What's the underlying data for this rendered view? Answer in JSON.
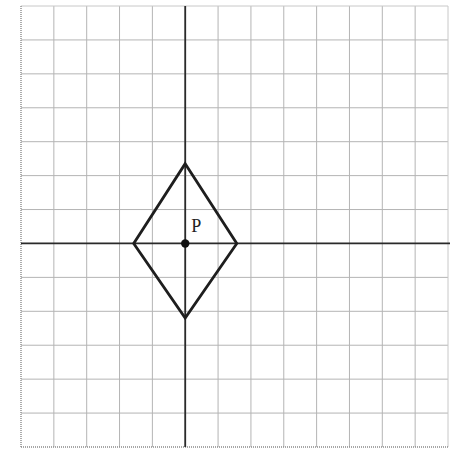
{
  "figure": {
    "type": "coordinate-grid-diagram",
    "grid": {
      "columns": 13,
      "rows": 13,
      "left": 21,
      "top": 6,
      "right": 448,
      "bottom": 447,
      "line_color": "#b4b4b4"
    },
    "axes": {
      "origin_column": 5,
      "origin_row": 7,
      "color": "#2a2a2a"
    },
    "shape": {
      "name": "rhombus",
      "stroke_color": "#1e1e1e",
      "vertices_grid_units": [
        {
          "name": "top",
          "x": 0,
          "y": 2.35
        },
        {
          "name": "right",
          "x": 1.57,
          "y": 0
        },
        {
          "name": "bottom",
          "x": 0,
          "y": -2.2
        },
        {
          "name": "left",
          "x": -1.57,
          "y": 0
        }
      ]
    },
    "point": {
      "label": "P",
      "x": 0,
      "y": 0,
      "color": "#111111"
    }
  }
}
